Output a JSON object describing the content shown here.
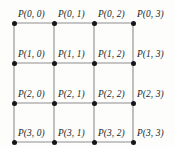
{
  "figure": {
    "type": "lattice-grid-diagram",
    "rows": 4,
    "cols": 4,
    "background_color": "#fdfdfc",
    "edge_color": "#8d8d8d",
    "node_color": "#16161a",
    "label_color": "#201f1f"
  },
  "chart_data": {
    "type": "scatter",
    "title": "",
    "xlabel": "",
    "ylabel": "",
    "grid": true,
    "legend": null,
    "x_positions": [
      14,
      54,
      94,
      133
    ],
    "y_positions": [
      23,
      63,
      103,
      142
    ],
    "nodes": [
      {
        "row": 0,
        "col": 0,
        "label": "P(0, 0)",
        "x": 14,
        "y": 23
      },
      {
        "row": 0,
        "col": 1,
        "label": "P(0, 1)",
        "x": 54,
        "y": 23
      },
      {
        "row": 0,
        "col": 2,
        "label": "P(0, 2)",
        "x": 94,
        "y": 23
      },
      {
        "row": 0,
        "col": 3,
        "label": "P(0, 3)",
        "x": 133,
        "y": 23
      },
      {
        "row": 1,
        "col": 0,
        "label": "P(1, 0)",
        "x": 14,
        "y": 63
      },
      {
        "row": 1,
        "col": 1,
        "label": "P(1, 1)",
        "x": 54,
        "y": 63
      },
      {
        "row": 1,
        "col": 2,
        "label": "P(1, 2)",
        "x": 94,
        "y": 63
      },
      {
        "row": 1,
        "col": 3,
        "label": "P(1, 3)",
        "x": 133,
        "y": 63
      },
      {
        "row": 2,
        "col": 0,
        "label": "P(2, 0)",
        "x": 14,
        "y": 103
      },
      {
        "row": 2,
        "col": 1,
        "label": "P(2, 1)",
        "x": 54,
        "y": 103
      },
      {
        "row": 2,
        "col": 2,
        "label": "P(2, 2)",
        "x": 94,
        "y": 103
      },
      {
        "row": 2,
        "col": 3,
        "label": "P(2, 3)",
        "x": 133,
        "y": 103
      },
      {
        "row": 3,
        "col": 0,
        "label": "P(3, 0)",
        "x": 14,
        "y": 142
      },
      {
        "row": 3,
        "col": 1,
        "label": "P(3, 1)",
        "x": 54,
        "y": 142
      },
      {
        "row": 3,
        "col": 2,
        "label": "P(3, 2)",
        "x": 94,
        "y": 142
      },
      {
        "row": 3,
        "col": 3,
        "label": "P(3, 3)",
        "x": 133,
        "y": 142
      }
    ],
    "edges": [
      {
        "from": [
          0,
          0
        ],
        "to": [
          0,
          1
        ]
      },
      {
        "from": [
          0,
          1
        ],
        "to": [
          0,
          2
        ]
      },
      {
        "from": [
          0,
          2
        ],
        "to": [
          0,
          3
        ]
      },
      {
        "from": [
          1,
          0
        ],
        "to": [
          1,
          1
        ]
      },
      {
        "from": [
          1,
          1
        ],
        "to": [
          1,
          2
        ]
      },
      {
        "from": [
          1,
          2
        ],
        "to": [
          1,
          3
        ]
      },
      {
        "from": [
          2,
          0
        ],
        "to": [
          2,
          1
        ]
      },
      {
        "from": [
          2,
          1
        ],
        "to": [
          2,
          2
        ]
      },
      {
        "from": [
          2,
          2
        ],
        "to": [
          2,
          3
        ]
      },
      {
        "from": [
          3,
          0
        ],
        "to": [
          3,
          1
        ]
      },
      {
        "from": [
          3,
          1
        ],
        "to": [
          3,
          2
        ]
      },
      {
        "from": [
          3,
          2
        ],
        "to": [
          3,
          3
        ]
      },
      {
        "from": [
          0,
          0
        ],
        "to": [
          1,
          0
        ]
      },
      {
        "from": [
          1,
          0
        ],
        "to": [
          2,
          0
        ]
      },
      {
        "from": [
          2,
          0
        ],
        "to": [
          3,
          0
        ]
      },
      {
        "from": [
          0,
          1
        ],
        "to": [
          1,
          1
        ]
      },
      {
        "from": [
          1,
          1
        ],
        "to": [
          2,
          1
        ]
      },
      {
        "from": [
          2,
          1
        ],
        "to": [
          3,
          1
        ]
      },
      {
        "from": [
          0,
          2
        ],
        "to": [
          1,
          2
        ]
      },
      {
        "from": [
          1,
          2
        ],
        "to": [
          2,
          2
        ]
      },
      {
        "from": [
          2,
          2
        ],
        "to": [
          3,
          2
        ]
      },
      {
        "from": [
          0,
          3
        ],
        "to": [
          1,
          3
        ]
      },
      {
        "from": [
          1,
          3
        ],
        "to": [
          2,
          3
        ]
      },
      {
        "from": [
          2,
          3
        ],
        "to": [
          3,
          3
        ]
      }
    ]
  }
}
